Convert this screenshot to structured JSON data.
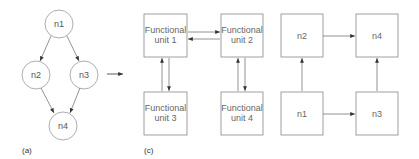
{
  "panels": {
    "a": {
      "label": "(a)",
      "nodes": [
        {
          "id": "n1",
          "label": "n1"
        },
        {
          "id": "n2",
          "label": "n2"
        },
        {
          "id": "n3",
          "label": "n3"
        },
        {
          "id": "n4",
          "label": "n4"
        }
      ],
      "edges": [
        [
          "n1",
          "n2"
        ],
        [
          "n1",
          "n3"
        ],
        [
          "n2",
          "n4"
        ],
        [
          "n3",
          "n4"
        ]
      ]
    },
    "c": {
      "label": "(c)",
      "units": [
        {
          "line1": "Functional",
          "line2": "unit 1"
        },
        {
          "line1": "Functional",
          "line2": "unit 2"
        },
        {
          "line1": "Functional",
          "line2": "unit 3"
        },
        {
          "line1": "Functional",
          "line2": "unit 4"
        }
      ],
      "links": [
        [
          "unit 1",
          "unit 2"
        ],
        [
          "unit 2",
          "unit 1"
        ],
        [
          "unit 3",
          "unit 1"
        ],
        [
          "unit 1",
          "unit 3"
        ],
        [
          "unit 4",
          "unit 2"
        ],
        [
          "unit 2",
          "unit 4"
        ]
      ]
    },
    "mapping": {
      "boxes": [
        {
          "id": "n2",
          "label": "n2"
        },
        {
          "id": "n4",
          "label": "n4"
        },
        {
          "id": "n1",
          "label": "n1"
        },
        {
          "id": "n3",
          "label": "n3"
        }
      ],
      "edges": [
        [
          "n2",
          "n4"
        ],
        [
          "n1",
          "n2"
        ],
        [
          "n1",
          "n3"
        ],
        [
          "n3",
          "n4"
        ]
      ]
    }
  },
  "colors": {
    "stroke": "#888888",
    "arrow": "#333333",
    "text": "#555555"
  }
}
